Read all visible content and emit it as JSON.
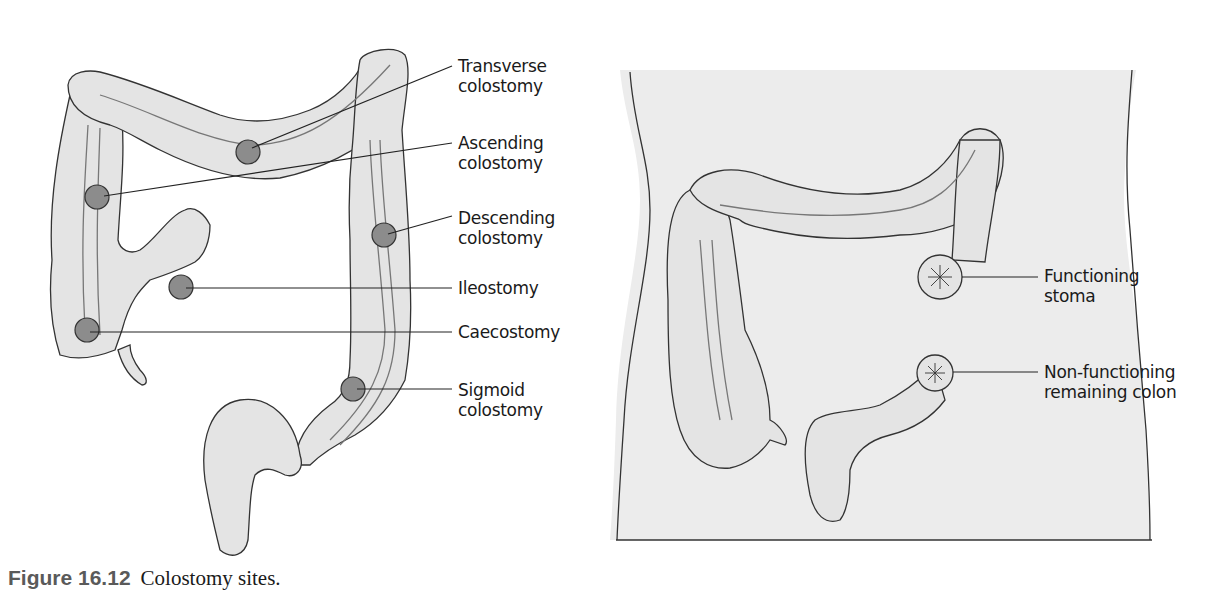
{
  "figure": {
    "number": "Figure 16.12",
    "caption": "Colostomy sites."
  },
  "left_panel": {
    "title": "Colostomy sites on colon",
    "labels": [
      {
        "id": "transverse",
        "line1": "Transverse",
        "line2": "colostomy"
      },
      {
        "id": "ascending",
        "line1": "Ascending",
        "line2": "colostomy"
      },
      {
        "id": "descending",
        "line1": "Descending",
        "line2": "colostomy"
      },
      {
        "id": "ileostomy",
        "line1": "Ileostomy",
        "line2": ""
      },
      {
        "id": "caecostomy",
        "line1": "Caecostomy",
        "line2": ""
      },
      {
        "id": "sigmoid",
        "line1": "Sigmoid",
        "line2": "colostomy"
      }
    ]
  },
  "right_panel": {
    "title": "Double-barrel stomas on abdomen",
    "labels": [
      {
        "id": "functioning",
        "line1": "Functioning",
        "line2": "stoma"
      },
      {
        "id": "nonfunctioning",
        "line1": "Non-functioning",
        "line2": "remaining colon"
      }
    ]
  },
  "colors": {
    "organ_fill": "#e4e4e4",
    "body_fill": "#ececec",
    "stoma_fill": "#8c8c8c",
    "outline": "#333333",
    "caption_number": "#5a5a5a"
  }
}
